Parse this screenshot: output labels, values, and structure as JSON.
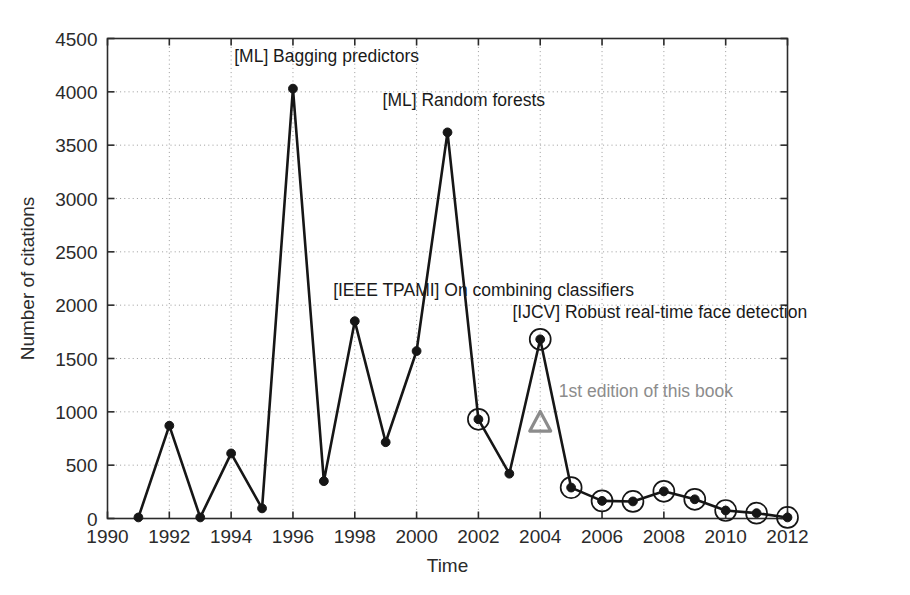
{
  "chart_data": {
    "type": "line",
    "title": "",
    "xlabel": "Time",
    "ylabel": "Number of citations",
    "xlim": [
      1990,
      2012
    ],
    "ylim": [
      0,
      4500
    ],
    "grid": true,
    "legend": "none",
    "x_ticks": [
      "1990",
      "1992",
      "1994",
      "1996",
      "1998",
      "2000",
      "2002",
      "2004",
      "2006",
      "2008",
      "2010",
      "2012"
    ],
    "y_ticks": [
      "0",
      "500",
      "1000",
      "1500",
      "2000",
      "2500",
      "3000",
      "3500",
      "4000",
      "4500"
    ],
    "x": [
      1991,
      1992,
      1993,
      1994,
      1995,
      1996,
      1997,
      1998,
      1999,
      2000,
      2001,
      2002,
      2003,
      2004,
      2005,
      2006,
      2007,
      2008,
      2009,
      2010,
      2011,
      2012
    ],
    "values": [
      10,
      870,
      10,
      610,
      95,
      4030,
      350,
      1850,
      715,
      1570,
      3620,
      930,
      420,
      1680,
      290,
      165,
      160,
      255,
      180,
      75,
      50,
      10
    ],
    "series": [
      {
        "name": "Number of citations",
        "values": [
          10,
          870,
          10,
          610,
          95,
          4030,
          350,
          1850,
          715,
          1570,
          3620,
          930,
          420,
          1680,
          290,
          165,
          160,
          255,
          180,
          75,
          50,
          10
        ]
      }
    ],
    "circled_points": [
      {
        "x": 2002,
        "y": 930
      },
      {
        "x": 2004,
        "y": 1680
      },
      {
        "x": 2005,
        "y": 290
      },
      {
        "x": 2006,
        "y": 165
      },
      {
        "x": 2007,
        "y": 160
      },
      {
        "x": 2008,
        "y": 255
      },
      {
        "x": 2009,
        "y": 180
      },
      {
        "x": 2010,
        "y": 75
      },
      {
        "x": 2011,
        "y": 50
      },
      {
        "x": 2012,
        "y": 10
      }
    ],
    "marker_triangle": {
      "x": 2004,
      "y": 900,
      "label": "1st edition of this book",
      "color": "#8c8c8c"
    },
    "annotations": [
      {
        "text": "[ML] Bagging predictors",
        "x": 1994.1,
        "y": 4280
      },
      {
        "text": "[ML] Random forests",
        "x": 1998.9,
        "y": 3870
      },
      {
        "text": "[IEEE TPAMI] On combining classifiers",
        "x": 1997.3,
        "y": 2090
      },
      {
        "text": "[IJCV] Robust real-time face detection",
        "x": 2003.1,
        "y": 1880
      },
      {
        "text": "1st edition of this book",
        "x": 2004.6,
        "y": 1140
      }
    ],
    "colors": {
      "line": "#161616",
      "marker": "#161616",
      "circle": "#161616",
      "triangle": "#8c8c8c",
      "grid": "#9a9a9a",
      "axis": "#2b2b2b",
      "annotation_gray": "#8c8c8c"
    }
  },
  "axis_titles": {
    "x": "Time",
    "y": "Number of citations"
  }
}
